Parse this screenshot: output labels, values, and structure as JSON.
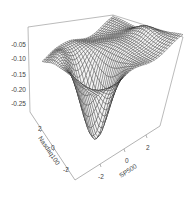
{
  "chart_data": {
    "type": "surface3d",
    "title": "",
    "xlabel": "SP500",
    "ylabel": "Nasdaq100",
    "zlabel": "",
    "x_ticks": [
      "-2",
      "0",
      "2"
    ],
    "y_ticks": [
      "-2",
      "0",
      "2"
    ],
    "z_ticks": [
      "-0.05",
      "-0.10",
      "-0.15",
      "-0.20",
      "-0.25"
    ],
    "xlim": [
      -3.5,
      3.5
    ],
    "ylim": [
      -3.5,
      3.5
    ],
    "zlim": [
      -0.3,
      -0.03
    ],
    "grid": false,
    "box": true,
    "surface_description": "Mostly flat plateau near z = -0.07 with a deep trough reaching about z = -0.29 along the front-left corner (low SP500, low Nasdaq100), raised ridges along the back-left and right edges",
    "colors": {
      "mesh": "#333333",
      "box": "#555555",
      "background": "#ffffff"
    }
  },
  "labels": {
    "z_ticks": [
      "-0.05",
      "-0.10",
      "-0.15",
      "-0.20",
      "-0.25"
    ],
    "x_title": "SP500",
    "x_ticks": [
      "-2",
      "0",
      "2"
    ],
    "y_title": "Nasdaq100",
    "y_ticks": [
      "2",
      "0",
      "-2"
    ]
  }
}
